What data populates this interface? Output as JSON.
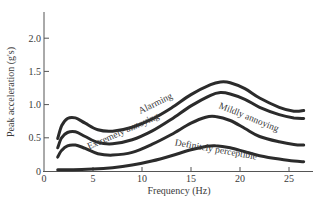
{
  "chart_data": {
    "type": "line",
    "title": "",
    "xlabel": "Frequency (Hz)",
    "ylabel": "Peak acceleration (g's)",
    "xlim": [
      0,
      27
    ],
    "ylim": [
      0,
      2.4
    ],
    "xticks": [
      0,
      5,
      10,
      15,
      20,
      25
    ],
    "yticks": [
      0,
      0.5,
      1.0,
      1.5,
      2.0
    ],
    "ytick_labels": [
      "0",
      "0.5",
      "1.0",
      "1.5",
      "2.0"
    ],
    "xtick_labels": [
      "0",
      "5",
      "10",
      "15",
      "20",
      "25"
    ],
    "grid": false,
    "legend": "inline curve labels",
    "series": [
      {
        "name": "Alarming",
        "x": [
          1.4,
          1.8,
          2.4,
          3.2,
          4.2,
          5.5,
          7,
          9,
          11,
          13,
          15,
          17,
          18,
          19,
          20.5,
          22,
          24,
          25.5,
          26.5
        ],
        "y": [
          0.49,
          0.68,
          0.79,
          0.8,
          0.72,
          0.62,
          0.6,
          0.66,
          0.78,
          0.95,
          1.15,
          1.3,
          1.34,
          1.33,
          1.24,
          1.1,
          0.96,
          0.9,
          0.91
        ]
      },
      {
        "name": "Extremely annoying",
        "x": [
          1.4,
          1.8,
          2.4,
          3.2,
          4.2,
          5.5,
          7,
          9,
          11,
          13,
          15,
          17,
          18,
          19,
          20.5,
          22,
          24,
          25.5,
          26.5
        ],
        "y": [
          0.35,
          0.5,
          0.58,
          0.59,
          0.52,
          0.43,
          0.41,
          0.47,
          0.6,
          0.78,
          0.98,
          1.14,
          1.18,
          1.16,
          1.08,
          0.96,
          0.85,
          0.8,
          0.79
        ]
      },
      {
        "name": "Mildly annoying",
        "x": [
          1.4,
          1.8,
          2.4,
          3.2,
          4.2,
          5.5,
          7,
          9,
          11,
          13,
          15,
          16.5,
          17.5,
          19,
          20.5,
          22,
          24,
          25.5,
          26.5
        ],
        "y": [
          0.21,
          0.31,
          0.38,
          0.39,
          0.34,
          0.26,
          0.24,
          0.28,
          0.4,
          0.55,
          0.72,
          0.81,
          0.82,
          0.76,
          0.64,
          0.52,
          0.44,
          0.4,
          0.39
        ]
      },
      {
        "name": "Definitely perceptible",
        "x": [
          1.4,
          3,
          5,
          7,
          9,
          11,
          13,
          15,
          16.5,
          17.5,
          19,
          20.5,
          22,
          24,
          25.5,
          26.5
        ],
        "y": [
          0.02,
          0.02,
          0.03,
          0.05,
          0.09,
          0.15,
          0.23,
          0.32,
          0.37,
          0.38,
          0.35,
          0.29,
          0.23,
          0.18,
          0.15,
          0.14
        ]
      }
    ],
    "annotations": [
      {
        "text": "Alarming",
        "x": 11.5,
        "y": 0.98,
        "rotation": -26
      },
      {
        "text": "Extremely annoying",
        "x": 8.2,
        "y": 0.56,
        "rotation": -24
      },
      {
        "text": "Mildly annoying",
        "x": 20.8,
        "y": 0.77,
        "rotation": 22
      },
      {
        "text": "Definitely perceptible",
        "x": 17.5,
        "y": 0.28,
        "rotation": 10
      }
    ]
  }
}
